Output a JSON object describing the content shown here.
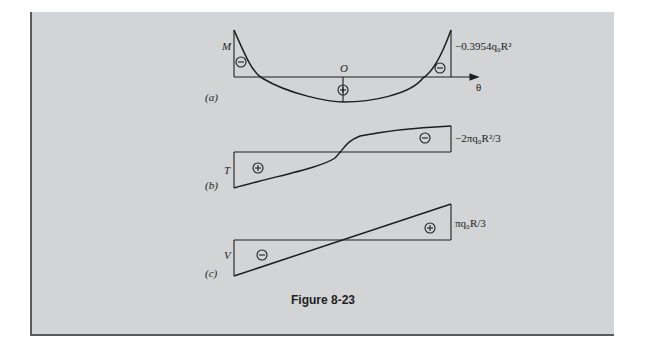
{
  "figure": {
    "caption": "Figure 8-23",
    "panels": [
      {
        "id": "a",
        "tag": "(a)",
        "axis_label": "M",
        "origin_label": "O",
        "x_axis_label": "θ",
        "end_value_label": "−0.3954q₀R²",
        "signs": [
          "⊖",
          "⊕",
          "⊖"
        ]
      },
      {
        "id": "b",
        "tag": "(b)",
        "axis_label": "T",
        "end_value_label": "−2πq₀R²/3",
        "signs": [
          "⊕",
          "⊖"
        ]
      },
      {
        "id": "c",
        "tag": "(c)",
        "axis_label": "V",
        "end_value_label": "πq₀R/3",
        "signs": [
          "⊖",
          "⊕"
        ]
      }
    ]
  },
  "colors": {
    "panel_bg": "#d3d4d6",
    "border": "#5a5b5d",
    "ink": "#1e1e1e"
  }
}
